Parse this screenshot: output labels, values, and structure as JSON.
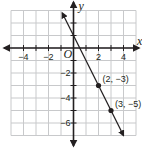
{
  "chart_data": {
    "type": "line",
    "title": "",
    "xlabel": "x",
    "ylabel": "y",
    "origin_label": "O",
    "xlim": [
      -5,
      5
    ],
    "ylim": [
      -7,
      3
    ],
    "grid": true,
    "x_ticks": [
      -4,
      -2,
      2,
      4
    ],
    "x_tick_labels": [
      "−4",
      "−2",
      "2",
      "4"
    ],
    "y_ticks": [
      -2,
      -4,
      -6
    ],
    "y_tick_labels": [
      "−2",
      "−4",
      "−6"
    ],
    "series": [
      {
        "name": "line",
        "equation": "y = -2x + 1",
        "x": [
          -0.9,
          4
        ],
        "y": [
          2.8,
          -7
        ],
        "arrows": "both"
      }
    ],
    "points": [
      {
        "x": 2,
        "y": -3,
        "label": "(2, −3)"
      },
      {
        "x": 3,
        "y": -5,
        "label": "(3, −5)"
      }
    ]
  },
  "colors": {
    "grid": "#c8c9cb",
    "axis": "#231f20",
    "line": "#231f20",
    "background": "#ffffff"
  }
}
